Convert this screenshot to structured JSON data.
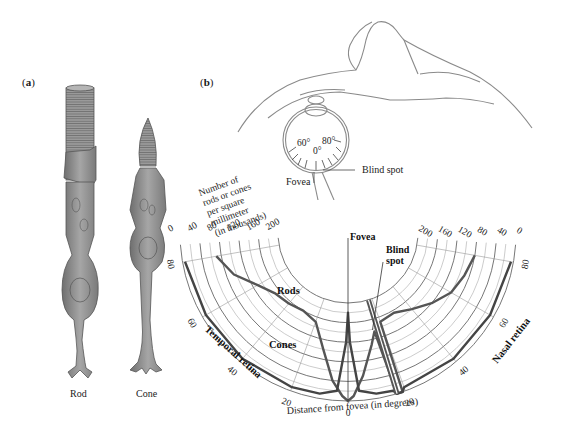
{
  "panel_a": {
    "label_open": "(",
    "label_letter": "a",
    "label_close": ")",
    "cells": [
      {
        "name": "Rod"
      },
      {
        "name": "Cone"
      }
    ]
  },
  "panel_b": {
    "label_open": "(",
    "label_letter": "b",
    "label_close": ")",
    "eye_diagram": {
      "angle_labels": [
        "60°",
        "80°",
        "0°"
      ],
      "fovea_label": "Fovea",
      "blind_spot_label": "Blind spot"
    }
  },
  "chart_data": {
    "type": "line",
    "projection": "polar-semicircle",
    "title": "",
    "ylabel": "Number of rods or cones per square millimeter (in thousands)",
    "xlabel": "Distance from fovea (in degrees)",
    "radial_ticks": [
      0,
      40,
      80,
      120,
      160,
      200
    ],
    "radial_range": [
      0,
      200
    ],
    "angle_ticks_temporal": [
      80,
      60,
      40,
      20
    ],
    "angle_ticks_nasal": [
      20,
      40,
      60,
      80
    ],
    "angle_tick_center": 0,
    "side_labels": {
      "left": "Temporal retina",
      "right": "Nasal retina"
    },
    "annotations": [
      {
        "text": "Fovea",
        "at_degrees": 0
      },
      {
        "text": "Blind spot",
        "at_degrees": 17
      }
    ],
    "series": [
      {
        "name": "Rods",
        "points": [
          {
            "deg": -80,
            "value": 70
          },
          {
            "deg": -70,
            "value": 95
          },
          {
            "deg": -60,
            "value": 130
          },
          {
            "deg": -50,
            "value": 150
          },
          {
            "deg": -40,
            "value": 155
          },
          {
            "deg": -30,
            "value": 160
          },
          {
            "deg": -20,
            "value": 150
          },
          {
            "deg": -12,
            "value": 100
          },
          {
            "deg": -6,
            "value": 40
          },
          {
            "deg": -2,
            "value": 10
          },
          {
            "deg": 0,
            "value": 0
          },
          {
            "deg": 2,
            "value": 10
          },
          {
            "deg": 6,
            "value": 50
          },
          {
            "deg": 12,
            "value": 110
          },
          {
            "deg": 15,
            "value": 135
          },
          {
            "deg": 17,
            "value": 0
          },
          {
            "deg": 19,
            "value": 0
          },
          {
            "deg": 20,
            "value": 150
          },
          {
            "deg": 30,
            "value": 155
          },
          {
            "deg": 40,
            "value": 140
          },
          {
            "deg": 50,
            "value": 120
          },
          {
            "deg": 60,
            "value": 100
          },
          {
            "deg": 70,
            "value": 90
          },
          {
            "deg": 80,
            "value": 80
          }
        ]
      },
      {
        "name": "Cones",
        "points": [
          {
            "deg": -80,
            "value": 5
          },
          {
            "deg": -60,
            "value": 8
          },
          {
            "deg": -40,
            "value": 8
          },
          {
            "deg": -20,
            "value": 8
          },
          {
            "deg": -10,
            "value": 10
          },
          {
            "deg": -4,
            "value": 20
          },
          {
            "deg": -1,
            "value": 120
          },
          {
            "deg": 0,
            "value": 180
          },
          {
            "deg": 1,
            "value": 120
          },
          {
            "deg": 4,
            "value": 20
          },
          {
            "deg": 10,
            "value": 10
          },
          {
            "deg": 16,
            "value": 8
          },
          {
            "deg": 17,
            "value": 0
          },
          {
            "deg": 19,
            "value": 0
          },
          {
            "deg": 20,
            "value": 8
          },
          {
            "deg": 40,
            "value": 8
          },
          {
            "deg": 60,
            "value": 8
          },
          {
            "deg": 80,
            "value": 5
          }
        ]
      }
    ]
  }
}
